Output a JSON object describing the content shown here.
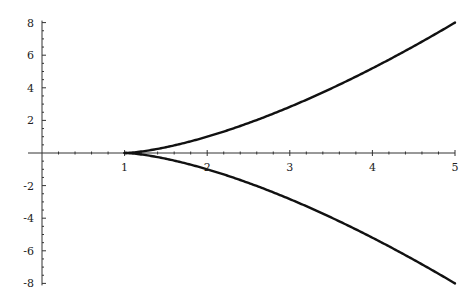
{
  "chart_data": {
    "type": "line",
    "title": "",
    "xlabel": "",
    "ylabel": "",
    "xlim": [
      0,
      5
    ],
    "ylim": [
      -8,
      8
    ],
    "grid": false,
    "legend": null,
    "x_ticks": [
      1,
      2,
      3,
      4,
      5
    ],
    "x_tick_labels": [
      "1",
      "2",
      "3",
      "4",
      "5"
    ],
    "y_ticks": [
      8,
      6,
      4,
      2,
      -2,
      -4,
      -6,
      -8
    ],
    "y_tick_labels": [
      "8",
      "6",
      "4",
      "2",
      "-2",
      "-4",
      "-6",
      "-8"
    ],
    "series": [
      {
        "name": "upper branch",
        "expression": "y = (x-1)^(3/2)",
        "x": [
          1,
          1.25,
          1.5,
          2,
          2.5,
          3,
          3.5,
          4,
          4.5,
          5
        ],
        "y": [
          0,
          0.125,
          0.354,
          1.0,
          1.837,
          2.828,
          3.953,
          5.196,
          6.548,
          8.0
        ]
      },
      {
        "name": "lower branch",
        "expression": "y = -(x-1)^(3/2)",
        "x": [
          1,
          1.25,
          1.5,
          2,
          2.5,
          3,
          3.5,
          4,
          4.5,
          5
        ],
        "y": [
          0,
          -0.125,
          -0.354,
          -1.0,
          -1.837,
          -2.828,
          -3.953,
          -5.196,
          -6.548,
          -8.0
        ]
      }
    ],
    "colors": {
      "curve": "#111111",
      "axis": "#333333",
      "background": "#ffffff"
    }
  }
}
